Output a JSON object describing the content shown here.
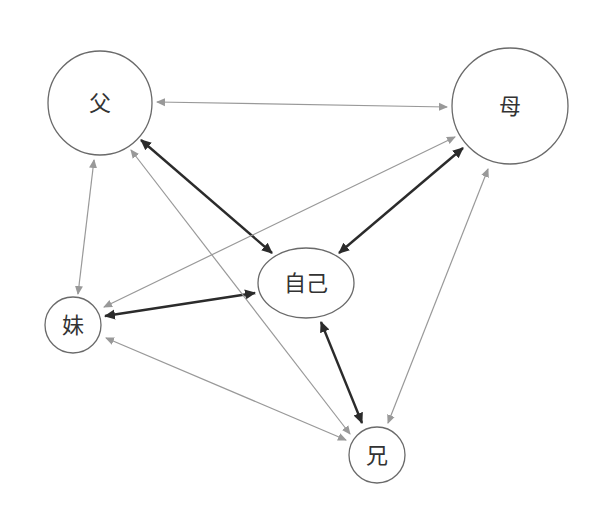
{
  "colors": {
    "strong_edge": "#2b2b2b",
    "weak_edge": "#999999",
    "node_stroke": "#6a6a6a",
    "label": "#333333",
    "background": "#ffffff"
  },
  "nodes": [
    {
      "id": "father",
      "label": "父",
      "shape": "circle",
      "cx": 100,
      "cy": 103,
      "r": 52
    },
    {
      "id": "mother",
      "label": "母",
      "shape": "circle",
      "cx": 510,
      "cy": 106,
      "r": 58
    },
    {
      "id": "self",
      "label": "自己",
      "shape": "ellipse",
      "cx": 306,
      "cy": 283,
      "rx": 48,
      "ry": 35
    },
    {
      "id": "sister",
      "label": "妹",
      "shape": "circle",
      "cx": 73,
      "cy": 325,
      "r": 28
    },
    {
      "id": "brother",
      "label": "兄",
      "shape": "circle",
      "cx": 377,
      "cy": 455,
      "r": 28
    }
  ],
  "edges": [
    {
      "from": "father",
      "to": "mother",
      "style": "weak",
      "bidirectional": true,
      "x1": 157,
      "y1": 102,
      "x2": 447,
      "y2": 107
    },
    {
      "from": "father",
      "to": "self",
      "style": "strong",
      "bidirectional": true,
      "x1": 141,
      "y1": 140,
      "x2": 272,
      "y2": 253
    },
    {
      "from": "mother",
      "to": "self",
      "style": "strong",
      "bidirectional": true,
      "x1": 463,
      "y1": 148,
      "x2": 339,
      "y2": 253
    },
    {
      "from": "father",
      "to": "sister",
      "style": "weak",
      "bidirectional": true,
      "x1": 94,
      "y1": 160,
      "x2": 78,
      "y2": 294
    },
    {
      "from": "sister",
      "to": "self",
      "style": "strong",
      "bidirectional": true,
      "x1": 105,
      "y1": 316,
      "x2": 255,
      "y2": 293
    },
    {
      "from": "mother",
      "to": "sister",
      "style": "weak",
      "bidirectional": true,
      "x1": 455,
      "y1": 137,
      "x2": 104,
      "y2": 307
    },
    {
      "from": "father",
      "to": "brother",
      "style": "weak",
      "bidirectional": true,
      "x1": 131,
      "y1": 150,
      "x2": 350,
      "y2": 434
    },
    {
      "from": "sister",
      "to": "brother",
      "style": "weak",
      "bidirectional": true,
      "x1": 106,
      "y1": 338,
      "x2": 346,
      "y2": 440
    },
    {
      "from": "self",
      "to": "brother",
      "style": "strong",
      "bidirectional": true,
      "x1": 321,
      "y1": 322,
      "x2": 362,
      "y2": 423
    },
    {
      "from": "mother",
      "to": "brother",
      "style": "weak",
      "bidirectional": true,
      "x1": 488,
      "y1": 169,
      "x2": 388,
      "y2": 423
    }
  ]
}
